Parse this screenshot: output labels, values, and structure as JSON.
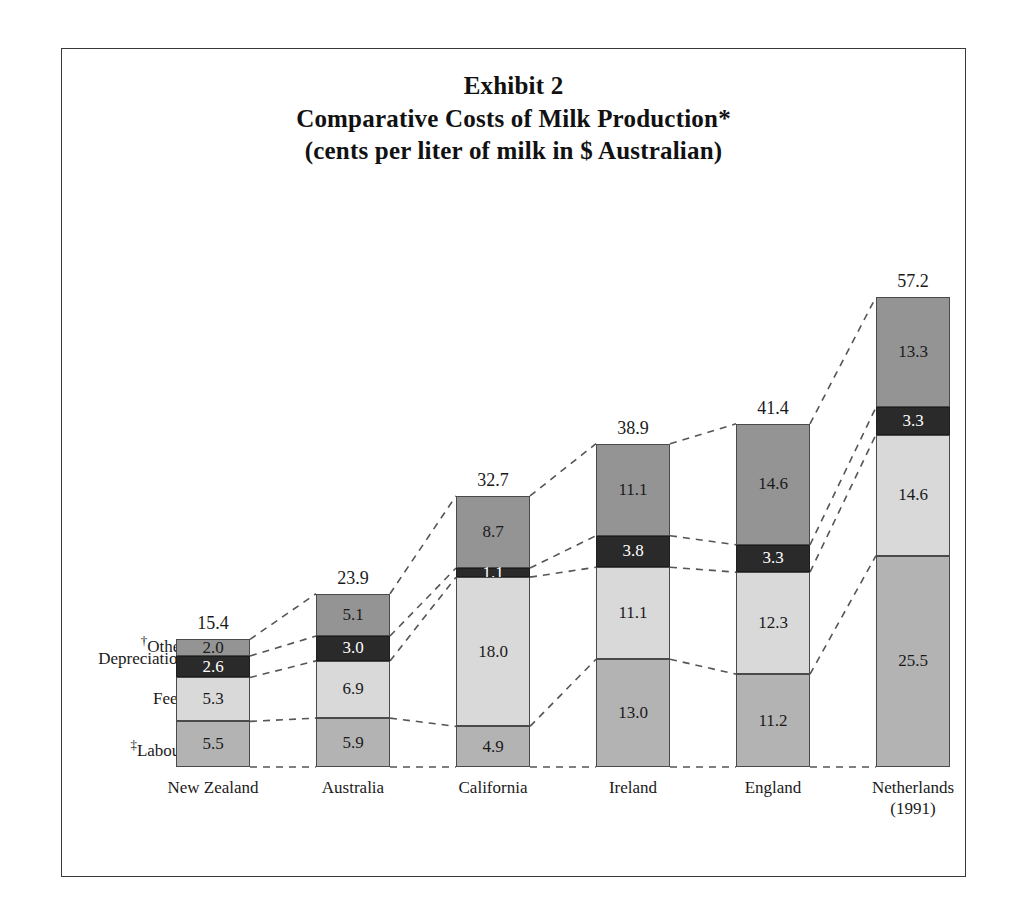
{
  "title": {
    "line1": "Exhibit 2",
    "line2": "Comparative Costs of Milk Production*",
    "line3": "(cents per liter of milk in $ Australian)"
  },
  "row_labels": [
    {
      "dagger": "†",
      "text": "Other"
    },
    {
      "dagger": "",
      "text": "Depreciation"
    },
    {
      "dagger": "",
      "text": "Feed"
    },
    {
      "dagger": "‡",
      "text": "Labour"
    }
  ],
  "colors": {
    "other": "#949494",
    "depreciation": "#2a2a2a",
    "feed": "#d9d9d9",
    "labour": "#b3b3b3",
    "border": "#4a4a4a",
    "frame": "#3a3a3a",
    "connector": "#555555",
    "background": "#ffffff"
  },
  "chart_data": {
    "type": "bar",
    "subtype": "stacked",
    "xlabel": "",
    "ylabel": "cents per liter of milk in $ Australian",
    "grid": false,
    "legend_position": "left-row-labels",
    "ylim": [
      0,
      57.2
    ],
    "categories": [
      "New Zealand",
      "Australia",
      "California",
      "Ireland",
      "England",
      "Netherlands"
    ],
    "category_sublabels": [
      "",
      "",
      "",
      "",
      "",
      "(1991)"
    ],
    "stack_order_bottom_to_top": [
      "Labour",
      "Feed",
      "Depreciation",
      "Other"
    ],
    "series": [
      {
        "name": "Labour",
        "values": [
          5.5,
          5.9,
          4.9,
          13.0,
          11.2,
          25.5
        ]
      },
      {
        "name": "Feed",
        "values": [
          5.3,
          6.9,
          18.0,
          11.1,
          12.3,
          14.6
        ]
      },
      {
        "name": "Depreciation",
        "values": [
          2.6,
          3.0,
          1.1,
          3.8,
          3.3,
          3.3
        ]
      },
      {
        "name": "Other",
        "values": [
          2.0,
          5.1,
          8.7,
          11.1,
          14.6,
          13.3
        ]
      }
    ],
    "totals": [
      15.4,
      23.9,
      32.7,
      38.9,
      41.4,
      57.2
    ],
    "bars": [
      {
        "category": "New Zealand",
        "sublabel": "",
        "total": "15.4",
        "segments": [
          {
            "key": "other",
            "label": "2.0",
            "value": 2.0
          },
          {
            "key": "depreciation",
            "label": "2.6",
            "value": 2.6
          },
          {
            "key": "feed",
            "label": "5.3",
            "value": 5.3
          },
          {
            "key": "labour",
            "label": "5.5",
            "value": 5.5
          }
        ]
      },
      {
        "category": "Australia",
        "sublabel": "",
        "total": "23.9",
        "segments": [
          {
            "key": "other",
            "label": "5.1",
            "value": 5.1
          },
          {
            "key": "depreciation",
            "label": "3.0",
            "value": 3.0
          },
          {
            "key": "feed",
            "label": "6.9",
            "value": 6.9
          },
          {
            "key": "labour",
            "label": "5.9",
            "value": 5.9
          }
        ]
      },
      {
        "category": "California",
        "sublabel": "",
        "total": "32.7",
        "segments": [
          {
            "key": "other",
            "label": "8.7",
            "value": 8.7
          },
          {
            "key": "depreciation",
            "label": "1.1",
            "value": 1.1
          },
          {
            "key": "feed",
            "label": "18.0",
            "value": 18.0
          },
          {
            "key": "labour",
            "label": "4.9",
            "value": 4.9
          }
        ]
      },
      {
        "category": "Ireland",
        "sublabel": "",
        "total": "38.9",
        "segments": [
          {
            "key": "other",
            "label": "11.1",
            "value": 11.1
          },
          {
            "key": "depreciation",
            "label": "3.8",
            "value": 3.8
          },
          {
            "key": "feed",
            "label": "11.1",
            "value": 11.1
          },
          {
            "key": "labour",
            "label": "13.0",
            "value": 13.0
          }
        ]
      },
      {
        "category": "England",
        "sublabel": "",
        "total": "41.4",
        "segments": [
          {
            "key": "other",
            "label": "14.6",
            "value": 14.6
          },
          {
            "key": "depreciation",
            "label": "3.3",
            "value": 3.3
          },
          {
            "key": "feed",
            "label": "12.3",
            "value": 12.3
          },
          {
            "key": "labour",
            "label": "11.2",
            "value": 11.2
          }
        ]
      },
      {
        "category": "Netherlands",
        "sublabel": "(1991)",
        "total": "57.2",
        "segments": [
          {
            "key": "other",
            "label": "13.3",
            "value": 13.3
          },
          {
            "key": "depreciation",
            "label": "3.3",
            "value": 3.3
          },
          {
            "key": "feed",
            "label": "14.6",
            "value": 14.6
          },
          {
            "key": "labour",
            "label": "25.5",
            "value": 25.5
          }
        ]
      }
    ]
  },
  "layout": {
    "baseline_y": 767,
    "px_per_unit": 8.29,
    "bar_width": 74,
    "first_bar_x": 176,
    "bar_pitch": 140
  }
}
